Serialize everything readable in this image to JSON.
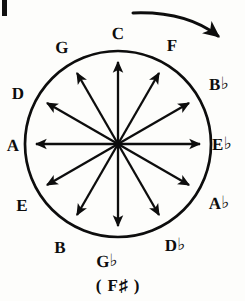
{
  "figure": {
    "background_color": "#fdfdfb",
    "ink_color": "#0d0d0d"
  },
  "circle": {
    "center_x": 118,
    "center_y": 144,
    "radius": 93,
    "stroke_width": 2.6
  },
  "direction_arrow": {
    "name": "clockwise-direction-arrow",
    "description": "curved arrow above circle pointing clockwise"
  },
  "corner_mark": {
    "name": "page-edge-artifact",
    "description": "vertical scan artifact at top-left corner"
  },
  "notes": [
    {
      "id": "c",
      "label": "C",
      "accidental": "",
      "angle": 0,
      "x": 118,
      "y": 33,
      "spoke": true
    },
    {
      "id": "f",
      "label": "F",
      "accidental": "",
      "angle": 30,
      "x": 172,
      "y": 45,
      "spoke": true
    },
    {
      "id": "bb",
      "label": "B",
      "accidental": "♭",
      "angle": 60,
      "x": 219,
      "y": 84,
      "spoke": true
    },
    {
      "id": "eb",
      "label": "E",
      "accidental": "♭",
      "angle": 90,
      "x": 222,
      "y": 144,
      "spoke": true
    },
    {
      "id": "ab",
      "label": "A",
      "accidental": "♭",
      "angle": 120,
      "x": 219,
      "y": 203,
      "spoke": true
    },
    {
      "id": "db",
      "label": "D",
      "accidental": "♭",
      "angle": 150,
      "x": 175,
      "y": 245,
      "spoke": true
    },
    {
      "id": "gb",
      "label": "G",
      "accidental": "♭",
      "angle": 180,
      "x": 107,
      "y": 261,
      "spoke": true
    },
    {
      "id": "b",
      "label": "B",
      "accidental": "",
      "angle": 210,
      "x": 60,
      "y": 247,
      "spoke": true
    },
    {
      "id": "e",
      "label": "E",
      "accidental": "",
      "angle": 240,
      "x": 22,
      "y": 205,
      "spoke": true
    },
    {
      "id": "a",
      "label": "A",
      "accidental": "",
      "angle": 270,
      "x": 13,
      "y": 145,
      "spoke": true
    },
    {
      "id": "d",
      "label": "D",
      "accidental": "",
      "angle": 300,
      "x": 18,
      "y": 93,
      "spoke": true
    },
    {
      "id": "g",
      "label": "G",
      "accidental": "",
      "angle": 330,
      "x": 62,
      "y": 47,
      "spoke": true
    }
  ],
  "enharmonic_note": {
    "text": "( F♯ )",
    "x": 118,
    "y": 285
  },
  "chart_data": {
    "type": "pie",
    "categories": [
      "C",
      "F",
      "B♭",
      "E♭",
      "A♭",
      "D♭",
      "G♭",
      "B",
      "E",
      "A",
      "D",
      "G"
    ],
    "values": [
      1,
      1,
      1,
      1,
      1,
      1,
      1,
      1,
      1,
      1,
      1,
      1
    ],
    "angles_deg": [
      0,
      30,
      60,
      90,
      120,
      150,
      180,
      210,
      240,
      270,
      300,
      330
    ],
    "annotations": [
      "( F♯ )",
      "clockwise direction arrow"
    ],
    "xlabel": "",
    "ylabel": "",
    "legend": "none",
    "grid": false
  }
}
